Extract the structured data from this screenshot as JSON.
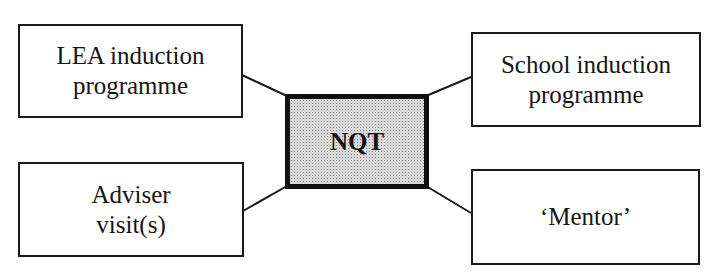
{
  "diagram": {
    "center": {
      "label": "NQT",
      "fill": "#d9d9d9"
    },
    "nodes": [
      {
        "id": "lea",
        "label": "LEA induction\nprogramme",
        "position": "top-left"
      },
      {
        "id": "school",
        "label": "School induction\nprogramme",
        "position": "top-right"
      },
      {
        "id": "adviser",
        "label": "Adviser\nvisit(s)",
        "position": "bottom-left"
      },
      {
        "id": "mentor",
        "label": "‘Mentor’",
        "position": "bottom-right"
      }
    ],
    "edges": [
      {
        "from": "lea",
        "to": "center"
      },
      {
        "from": "school",
        "to": "center"
      },
      {
        "from": "adviser",
        "to": "center"
      },
      {
        "from": "mentor",
        "to": "center"
      }
    ],
    "colors": {
      "line": "#1a1a1a",
      "background": "#ffffff"
    }
  }
}
